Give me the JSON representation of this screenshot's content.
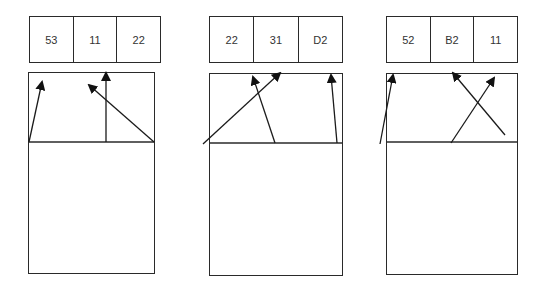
{
  "panels": [
    {
      "name": "panel-1",
      "cells": [
        "53",
        "11",
        "22"
      ],
      "header": {
        "x": 29,
        "y": 16,
        "w": 132,
        "h": 47
      },
      "box": {
        "x": 28,
        "y": 72,
        "w": 127,
        "h": 202
      },
      "baseline_y": 142,
      "arrows": [
        {
          "x1": 29,
          "y1": 142,
          "x2": 42,
          "y2": 82
        },
        {
          "x1": 106,
          "y1": 142,
          "x2": 106,
          "y2": 73
        },
        {
          "x1": 154,
          "y1": 142,
          "x2": 89,
          "y2": 85
        }
      ]
    },
    {
      "name": "panel-2",
      "cells": [
        "22",
        "31",
        "D2"
      ],
      "header": {
        "x": 209,
        "y": 16,
        "w": 134,
        "h": 47
      },
      "box": {
        "x": 209,
        "y": 73,
        "w": 134,
        "h": 203
      },
      "baseline_y": 143,
      "arrows": [
        {
          "x1": 203,
          "y1": 144,
          "x2": 280,
          "y2": 73
        },
        {
          "x1": 275,
          "y1": 143,
          "x2": 253,
          "y2": 77
        },
        {
          "x1": 337,
          "y1": 143,
          "x2": 331,
          "y2": 75
        }
      ]
    },
    {
      "name": "panel-3",
      "cells": [
        "52",
        "B2",
        "11"
      ],
      "header": {
        "x": 386,
        "y": 16,
        "w": 132,
        "h": 47
      },
      "box": {
        "x": 386,
        "y": 73,
        "w": 132,
        "h": 202
      },
      "baseline_y": 142,
      "arrows": [
        {
          "x1": 380,
          "y1": 144,
          "x2": 393,
          "y2": 75
        },
        {
          "x1": 505,
          "y1": 135,
          "x2": 453,
          "y2": 73
        },
        {
          "x1": 451,
          "y1": 143,
          "x2": 494,
          "y2": 78
        }
      ]
    }
  ],
  "colors": {
    "stroke": "#2a2a2a",
    "text": "#333333",
    "background": "#ffffff"
  }
}
